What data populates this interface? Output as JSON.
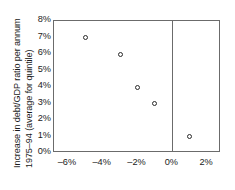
{
  "chart_data": {
    "type": "scatter",
    "title": "",
    "subtitle": "",
    "xlabel": "",
    "ylabel": "Increase in debt/GDP ratio per annum 1975–94 (average for quintile)",
    "ylabel_lines": [
      "Increase in debt/GDP ratio per annum",
      "1975–94 (average for quintile)"
    ],
    "xlim": [
      -6.8,
      2.8
    ],
    "ylim": [
      0,
      8
    ],
    "grid": false,
    "legend": null,
    "xunit": "%",
    "yunit": "%",
    "xticks": [
      -6,
      -4,
      -2,
      0,
      2
    ],
    "xtick_labels": [
      "–6%",
      "–4%",
      "–2%",
      "0%",
      "2%"
    ],
    "yticks": [
      0,
      1,
      2,
      3,
      4,
      5,
      6,
      7,
      8
    ],
    "ytick_labels": [
      "0%",
      "1%",
      "2%",
      "3%",
      "4%",
      "5%",
      "6%",
      "7%",
      "8%"
    ],
    "reference_lines": [
      {
        "name": "zero-vertical-line",
        "axis": "x",
        "value": 0
      }
    ],
    "marker_style": "open-circle",
    "points": [
      {
        "x": -5,
        "y": 7
      },
      {
        "x": -3,
        "y": 6
      },
      {
        "x": -2,
        "y": 4
      },
      {
        "x": -1,
        "y": 3
      },
      {
        "x": 1,
        "y": 1
      }
    ],
    "series": [
      {
        "name": "quintile averages",
        "x": [
          -5,
          -3,
          -2,
          -1,
          1
        ],
        "values": [
          7,
          6,
          4,
          3,
          1
        ]
      }
    ],
    "colors": {
      "marker_stroke": "#2b2b2b",
      "marker_fill": "#ffffff",
      "frame": "#6b6b6b",
      "text": "#1a1a1a",
      "background": "#ffffff"
    }
  }
}
